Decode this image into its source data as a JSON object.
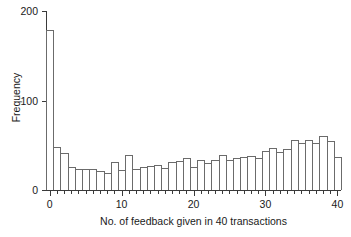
{
  "chart_data": {
    "type": "bar",
    "title": "",
    "xlabel": "No. of feedback given in 40 transactions",
    "ylabel": "Frequency",
    "xlim": [
      0,
      41
    ],
    "ylim": [
      0,
      200
    ],
    "grid": false,
    "legend": null,
    "x_ticks_major": [
      0,
      10,
      20,
      30,
      40
    ],
    "x_tick_labels": [
      "0",
      "10",
      "20",
      "30",
      "40"
    ],
    "x_minor_tick_step": 1,
    "y_ticks": [
      0,
      100,
      200
    ],
    "y_tick_labels": [
      "0",
      "100",
      "200"
    ],
    "categories": [
      0,
      1,
      2,
      3,
      4,
      5,
      6,
      7,
      8,
      9,
      10,
      11,
      12,
      13,
      14,
      15,
      16,
      17,
      18,
      19,
      20,
      21,
      22,
      23,
      24,
      25,
      26,
      27,
      28,
      29,
      30,
      31,
      32,
      33,
      34,
      35,
      36,
      37,
      38,
      39,
      40
    ],
    "values": [
      179,
      48,
      41,
      26,
      23,
      23,
      24,
      21,
      19,
      31,
      22,
      39,
      23,
      26,
      27,
      28,
      25,
      31,
      32,
      36,
      26,
      34,
      30,
      34,
      39,
      33,
      36,
      37,
      38,
      36,
      44,
      47,
      43,
      46,
      56,
      53,
      56,
      53,
      60,
      55,
      37
    ],
    "colors": {
      "bar_fill": "#ffffff",
      "bar_edge": "#6b6b6b",
      "axis": "#3a3a3a",
      "text": "#1a1a1a",
      "background": "#ffffff"
    }
  }
}
